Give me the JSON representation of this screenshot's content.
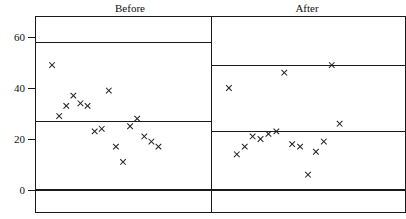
{
  "chart_data": {
    "type": "scatter",
    "title": "",
    "xlabel": "",
    "ylabel": "",
    "ylim": [
      0,
      62
    ],
    "yticks": [
      0,
      20,
      40,
      60
    ],
    "ytick_labels": [
      "0",
      "20",
      "40",
      "60"
    ],
    "grid": false,
    "legend": "none",
    "panels": [
      {
        "label": "Before",
        "xlim": [
          0,
          22
        ],
        "mean_line": 27,
        "reference_lines": [
          0,
          58
        ],
        "points": [
          {
            "x": 1,
            "y": 49
          },
          {
            "x": 2,
            "y": 29
          },
          {
            "x": 3,
            "y": 33
          },
          {
            "x": 4,
            "y": 37
          },
          {
            "x": 5,
            "y": 34
          },
          {
            "x": 6,
            "y": 33
          },
          {
            "x": 7,
            "y": 23
          },
          {
            "x": 8,
            "y": 24
          },
          {
            "x": 9,
            "y": 39
          },
          {
            "x": 10,
            "y": 17
          },
          {
            "x": 11,
            "y": 11
          },
          {
            "x": 12,
            "y": 25
          },
          {
            "x": 13,
            "y": 28
          },
          {
            "x": 14,
            "y": 21
          },
          {
            "x": 15,
            "y": 19
          },
          {
            "x": 16,
            "y": 17
          }
        ]
      },
      {
        "label": "After",
        "xlim": [
          0,
          22
        ],
        "mean_line": 23,
        "reference_lines": [
          0,
          49
        ],
        "points": [
          {
            "x": 1,
            "y": 40
          },
          {
            "x": 2,
            "y": 14
          },
          {
            "x": 3,
            "y": 17
          },
          {
            "x": 4,
            "y": 21
          },
          {
            "x": 5,
            "y": 20
          },
          {
            "x": 6,
            "y": 22
          },
          {
            "x": 7,
            "y": 23
          },
          {
            "x": 8,
            "y": 46
          },
          {
            "x": 9,
            "y": 18
          },
          {
            "x": 10,
            "y": 17
          },
          {
            "x": 11,
            "y": 6
          },
          {
            "x": 12,
            "y": 15
          },
          {
            "x": 13,
            "y": 19
          },
          {
            "x": 14,
            "y": 49
          },
          {
            "x": 15,
            "y": 26
          }
        ]
      }
    ]
  },
  "axis": {
    "tick_0": "0",
    "tick_20": "20",
    "tick_40": "40",
    "tick_60": "60"
  },
  "titles": {
    "left_panel": "Before",
    "right_panel": "After"
  },
  "colors": {
    "ink": "#1a1a1a",
    "marker": "#222222",
    "background": "#ffffff"
  }
}
